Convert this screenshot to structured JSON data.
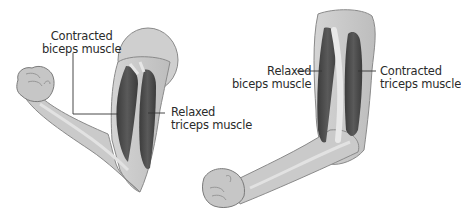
{
  "diagram": {
    "type": "anatomy",
    "panels": [
      {
        "id": "flexed-arm",
        "labels": [
          {
            "line1": "Contracted",
            "line2": "biceps muscle"
          },
          {
            "line1": "Relaxed",
            "line2": "triceps muscle"
          }
        ]
      },
      {
        "id": "extended-arm",
        "labels": [
          {
            "line1": "Relaxed",
            "line2": "biceps muscle"
          },
          {
            "line1": "Contracted",
            "line2": "triceps muscle"
          }
        ]
      }
    ]
  },
  "colors": {
    "skin": "#c9c9c9",
    "skin_light": "#dcdcdc",
    "outline": "#7a7a7a",
    "muscle_dark": "#4a4a4a",
    "bone": "#e6e6e6",
    "text": "#2b2b2b",
    "leader_line": "#333333"
  }
}
